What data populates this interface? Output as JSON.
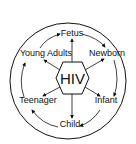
{
  "diagram": {
    "center_label": "HIV",
    "stages": [
      {
        "label": "Fetus",
        "x": 69,
        "y": 36
      },
      {
        "label": "Newborn",
        "x": 105,
        "y": 56
      },
      {
        "label": "Infant",
        "x": 106,
        "y": 103
      },
      {
        "label": "Child",
        "x": 69,
        "y": 127
      },
      {
        "label": "Teenager",
        "x": 34,
        "y": 103
      },
      {
        "label": "Young Adults",
        "x": 38,
        "y": 56
      }
    ],
    "colors": {
      "line": "#111111",
      "background": "#ffffff"
    }
  }
}
